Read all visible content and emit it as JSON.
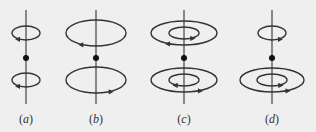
{
  "figure": {
    "background": "#efefef",
    "stroke_color": "#333333",
    "panels": [
      {
        "id": "a",
        "label": "(a)",
        "label_letter": "a",
        "axis_x": 26,
        "upper_loops": [
          {
            "rx": 14,
            "ry": 7,
            "arrow": "left"
          }
        ],
        "lower_loops": [
          {
            "rx": 14,
            "ry": 7,
            "arrow": "left"
          }
        ]
      },
      {
        "id": "b",
        "label": "(b)",
        "label_letter": "b",
        "axis_x": 96,
        "upper_loops": [
          {
            "rx": 30,
            "ry": 13,
            "arrow": "left"
          }
        ],
        "lower_loops": [
          {
            "rx": 30,
            "ry": 13,
            "arrow": "right"
          }
        ]
      },
      {
        "id": "c",
        "label": "(c)",
        "label_letter": "c",
        "axis_x": 184,
        "upper_loops": [
          {
            "rx": 33,
            "ry": 12,
            "arrow": "left"
          },
          {
            "rx": 15,
            "ry": 6,
            "arrow": "right"
          }
        ],
        "lower_loops": [
          {
            "rx": 33,
            "ry": 12,
            "arrow": "right"
          },
          {
            "rx": 15,
            "ry": 6,
            "arrow": "left"
          }
        ]
      },
      {
        "id": "d",
        "label": "(d)",
        "label_letter": "d",
        "axis_x": 272,
        "upper_loops": [
          {
            "rx": 14,
            "ry": 7,
            "arrow": "right"
          }
        ],
        "lower_loops": [
          {
            "rx": 32,
            "ry": 12,
            "arrow": "right"
          },
          {
            "rx": 15,
            "ry": 6,
            "arrow": "right"
          }
        ]
      }
    ]
  }
}
